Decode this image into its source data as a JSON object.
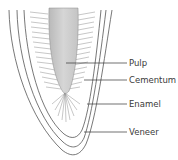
{
  "diagram": {
    "labels": [
      {
        "id": "pulp",
        "text": "Pulp"
      },
      {
        "id": "cementum",
        "text": "Cementum"
      },
      {
        "id": "enamel",
        "text": "Enamel"
      },
      {
        "id": "veneer",
        "text": "Veneer"
      }
    ],
    "colors": {
      "outline": "#555555",
      "pulp_fill": "#c9c9c9",
      "hatch": "#8a8a8a",
      "leader": "#333333",
      "text": "#3a3a3a"
    }
  }
}
